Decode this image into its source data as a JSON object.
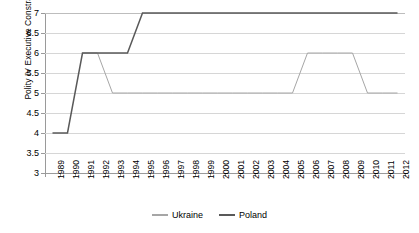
{
  "chart_data": {
    "type": "line",
    "title": "",
    "xlabel": "",
    "ylabel": "Polity IV Executive Constraints",
    "ylim": [
      3,
      7
    ],
    "ytick_values": [
      7,
      6.5,
      6,
      5.5,
      5,
      4.5,
      4,
      3.5,
      3
    ],
    "ytick_labels": [
      "7",
      "6.5",
      "6",
      "5.5",
      "5",
      "4.5",
      "4",
      "3.5",
      "3"
    ],
    "grid": true,
    "grid_axis": "y",
    "legend_position": "bottom-center",
    "categories": [
      "1989",
      "1990",
      "1991",
      "1992",
      "1993",
      "1994",
      "1995",
      "1996",
      "1997",
      "1998",
      "1999",
      "2000",
      "2001",
      "2002",
      "2003",
      "2004",
      "2005",
      "2006",
      "2007",
      "2008",
      "2009",
      "2010",
      "2011",
      "2012"
    ],
    "series": [
      {
        "name": "Ukraine",
        "color": "#a6a6a6",
        "values": [
          null,
          null,
          6,
          6,
          5,
          5,
          5,
          5,
          5,
          5,
          5,
          5,
          5,
          5,
          5,
          5,
          5,
          6,
          6,
          6,
          6,
          5,
          5,
          5
        ]
      },
      {
        "name": "Poland",
        "color": "#595959",
        "values": [
          4,
          4,
          6,
          6,
          6,
          6,
          7,
          7,
          7,
          7,
          7,
          7,
          7,
          7,
          7,
          7,
          7,
          7,
          7,
          7,
          7,
          7,
          7,
          7
        ]
      }
    ]
  },
  "legend": {
    "entries": [
      {
        "label": "Ukraine"
      },
      {
        "label": "Poland"
      }
    ]
  },
  "colors": {
    "ukraine_line": "#a6a6a6",
    "poland_line": "#595959",
    "gridline": "#d6d6d6",
    "axis": "#9a9a9a",
    "background": "#ffffff"
  }
}
